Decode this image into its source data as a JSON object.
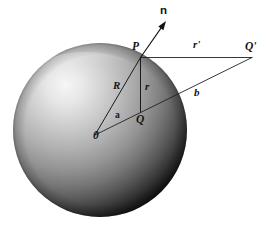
{
  "figure": {
    "background_color": "#ffffff",
    "line_color": "#1a1a1a"
  },
  "sphere": {
    "name": "shaded-sphere",
    "center_x": 100,
    "center_y": 130,
    "radius": 87,
    "highlight_color": "#f2f2f2",
    "mid_color": "#9a9a9a",
    "shadow_color": "#141414"
  },
  "points": [
    {
      "id": "O",
      "label": "0",
      "x": 140.5,
      "y": 130.0,
      "label_x": 93,
      "label_y": 139
    },
    {
      "id": "P",
      "label": "P",
      "x": 140.5,
      "y": 57.5,
      "label_x": 132,
      "label_y": 50
    },
    {
      "id": "Q",
      "label": "Q",
      "x": 140.5,
      "y": 112.0,
      "label_x": 136,
      "label_y": 123
    },
    {
      "id": "Qp",
      "label": "Q'",
      "x": 252.0,
      "y": 57.5,
      "label_x": 245,
      "label_y": 50
    }
  ],
  "segments": [
    {
      "id": "R",
      "label": "R",
      "from": "O",
      "to": "P",
      "label_x": 113,
      "label_y": 89
    },
    {
      "id": "r",
      "label": "r",
      "from": "P",
      "to": "Q",
      "label_x": 145,
      "label_y": 90
    },
    {
      "id": "rp",
      "label": "r'",
      "from": "P",
      "to": "Qp",
      "label_x": 193,
      "label_y": 48
    },
    {
      "id": "b",
      "label": "b",
      "from": "O",
      "to": "Qp",
      "label_x": 194,
      "label_y": 96
    }
  ],
  "angle": {
    "id": "alpha",
    "label": "a",
    "label_x": 115,
    "label_y": 118,
    "vertex": "O"
  },
  "normal_vector": {
    "id": "n",
    "label": "n",
    "from_x": 140.5,
    "from_y": 57.5,
    "tip_x": 166,
    "tip_y": 21,
    "label_x": 160,
    "label_y": 14
  }
}
